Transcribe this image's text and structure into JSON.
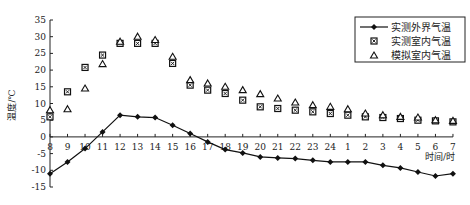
{
  "chart_data": {
    "type": "line",
    "title": "",
    "xlabel": "时间/时",
    "ylabel": "温度/℃",
    "ylim": [
      -15,
      35
    ],
    "yticks": [
      35,
      30,
      25,
      20,
      15,
      10,
      5,
      0,
      -5,
      -10,
      -15
    ],
    "grid": false,
    "legend_position": "upper right",
    "categories": [
      "8",
      "9",
      "10",
      "11",
      "12",
      "13",
      "14",
      "15",
      "16",
      "17",
      "18",
      "19",
      "20",
      "21",
      "22",
      "23",
      "24",
      "1",
      "2",
      "3",
      "4",
      "5",
      "6",
      "7"
    ],
    "series": [
      {
        "name": "实测外界气温",
        "marker": "filled-diamond-line",
        "values": [
          -11,
          -7.5,
          -3.5,
          1.5,
          6.5,
          6,
          5.8,
          3.5,
          1,
          -1.5,
          -3.8,
          -4.8,
          -6,
          -6.3,
          -6.5,
          -7,
          -7.5,
          -7.5,
          -7.5,
          -8.5,
          -9.3,
          -10.5,
          -11.7,
          -11
        ]
      },
      {
        "name": "实测室内气温",
        "marker": "boxed-x-square",
        "values": [
          6,
          13.5,
          20.8,
          24.5,
          28,
          28,
          28,
          22,
          15.5,
          14,
          13,
          11,
          9,
          8.5,
          8,
          7.5,
          7,
          6.5,
          6,
          5.8,
          5.5,
          5,
          4.8,
          4.5
        ]
      },
      {
        "name": "模拟室内气温",
        "marker": "open-triangle",
        "values": [
          8,
          8.3,
          14.5,
          21.8,
          28.5,
          30,
          29,
          24,
          17,
          16,
          15,
          14,
          12.8,
          11.5,
          10.3,
          9.5,
          9,
          8.3,
          7,
          6.5,
          6,
          5.8,
          5,
          4.8
        ]
      }
    ]
  },
  "axis": {
    "y_label": "温度/℃",
    "x_label": "时间/时"
  },
  "legend": {
    "items": [
      {
        "label": "实测外界气温"
      },
      {
        "label": "实测室内气温"
      },
      {
        "label": "模拟室内气温"
      }
    ]
  }
}
